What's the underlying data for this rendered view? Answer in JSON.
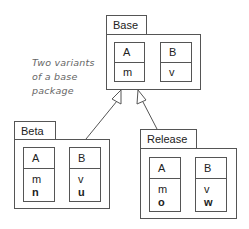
{
  "annotation": {
    "lines": [
      "Two variants",
      "of a base",
      "package"
    ]
  },
  "packages": {
    "base": {
      "name": "Base",
      "classes": [
        {
          "name": "A",
          "members": [
            "m"
          ],
          "bold_members": []
        },
        {
          "name": "B",
          "members": [
            "v"
          ],
          "bold_members": []
        }
      ]
    },
    "beta": {
      "name": "Beta",
      "classes": [
        {
          "name": "A",
          "members": [
            "m"
          ],
          "bold_members": [
            "n"
          ]
        },
        {
          "name": "B",
          "members": [
            "v"
          ],
          "bold_members": [
            "u"
          ]
        }
      ]
    },
    "release": {
      "name": "Release",
      "classes": [
        {
          "name": "A",
          "members": [
            "m"
          ],
          "bold_members": [
            "o"
          ]
        },
        {
          "name": "B",
          "members": [
            "v"
          ],
          "bold_members": [
            "w"
          ]
        }
      ]
    }
  },
  "relations": [
    {
      "from": "Beta",
      "to": "Base",
      "type": "generalization"
    },
    {
      "from": "Release",
      "to": "Base",
      "type": "generalization"
    }
  ],
  "colors": {
    "line": "#555555",
    "note_text": "#666666",
    "background": "#ffffff"
  }
}
